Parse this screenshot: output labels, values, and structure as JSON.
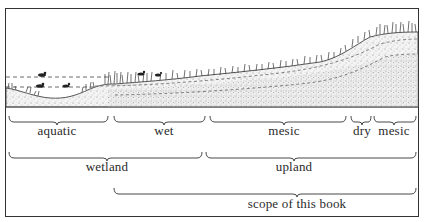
{
  "diagram": {
    "type": "landscape-cross-section",
    "zones_row1": [
      {
        "label": "aquatic",
        "x1": 9,
        "x2": 108,
        "cx": 57
      },
      {
        "label": "wet",
        "x1": 114,
        "x2": 205,
        "cx": 164
      },
      {
        "label": "mesic",
        "x1": 210,
        "x2": 346,
        "cx": 284
      },
      {
        "label": "dry",
        "x1": 351,
        "x2": 371,
        "cx": 362
      },
      {
        "label": "mesic",
        "x1": 374,
        "x2": 416,
        "cx": 394
      }
    ],
    "zones_row2": [
      {
        "label": "wetland",
        "x1": 9,
        "x2": 202,
        "cx": 107
      },
      {
        "label": "upland",
        "x1": 206,
        "x2": 416,
        "cx": 294
      }
    ],
    "zones_row3": [
      {
        "label": "scope of this book",
        "x1": 114,
        "x2": 416,
        "cx": 297
      }
    ]
  },
  "colors": {
    "ink": "#2a2a2a",
    "soil": "#c9c9c9",
    "frame": "#333333"
  }
}
